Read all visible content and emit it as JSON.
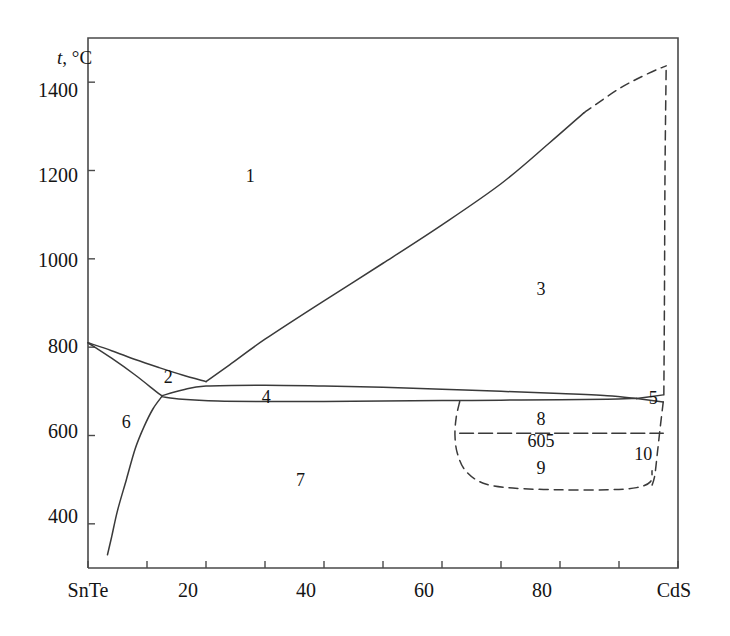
{
  "figure": {
    "kind": "binary-phase-diagram",
    "system": "SnTe - CdS"
  },
  "axes": {
    "y_title_symbol": "t",
    "y_title_unit": ", °C",
    "y_ticks": [
      "1400",
      "1200",
      "1000",
      "800",
      "600",
      "400"
    ],
    "x_ticks": [
      "SnTe",
      "20",
      "40",
      "60",
      "80",
      "CdS"
    ]
  },
  "annotations": {
    "region_1": "1",
    "region_2": "2",
    "region_3": "3",
    "region_4": "4",
    "region_5": "5",
    "region_6": "6",
    "region_7": "7",
    "region_8": "8",
    "region_9": "9",
    "region_10": "10",
    "invariant_temperature": "605"
  },
  "colors": {
    "line": "#3a3a3a",
    "frame": "#4a4a4a",
    "text": "#141414",
    "background": "#ffffff"
  },
  "chart_data": {
    "type": "line",
    "title": "",
    "xlabel": "",
    "ylabel": "t, °C",
    "xlim": [
      0,
      100
    ],
    "ylim": [
      300,
      1500
    ],
    "x_tick_values": [
      0,
      20,
      40,
      60,
      80,
      100
    ],
    "x_tick_labels": [
      "SnTe",
      "20",
      "40",
      "60",
      "80",
      "CdS"
    ],
    "y_tick_values": [
      400,
      600,
      800,
      1000,
      1200,
      1400
    ],
    "y_tick_labels": [
      "400",
      "600",
      "800",
      "1000",
      "1200",
      "1400"
    ],
    "grid": false,
    "legend": "none",
    "series": [
      {
        "name": "liquidus-left-branch",
        "style": "solid",
        "points": [
          [
            0,
            810
          ],
          [
            4,
            792
          ],
          [
            8,
            772
          ],
          [
            12,
            754
          ],
          [
            16,
            737
          ],
          [
            20,
            722
          ]
        ]
      },
      {
        "name": "solidus-left-branch-to-eutectic",
        "style": "solid",
        "points": [
          [
            0,
            810
          ],
          [
            4,
            775
          ],
          [
            8,
            737
          ],
          [
            11.5,
            700
          ],
          [
            12.5,
            690
          ]
        ]
      },
      {
        "name": "liquidus-right-branch-solid",
        "style": "solid",
        "points": [
          [
            20,
            722
          ],
          [
            24,
            760
          ],
          [
            30,
            818
          ],
          [
            40,
            905
          ],
          [
            50,
            990
          ],
          [
            60,
            1077
          ],
          [
            70,
            1170
          ],
          [
            78,
            1260
          ],
          [
            84,
            1330
          ]
        ]
      },
      {
        "name": "liquidus-right-branch-dashed",
        "style": "dashed",
        "points": [
          [
            84,
            1330
          ],
          [
            90,
            1385
          ],
          [
            95,
            1420
          ],
          [
            98,
            1437
          ]
        ]
      },
      {
        "name": "upper-solidus-plateau",
        "style": "solid",
        "points": [
          [
            12.5,
            690
          ],
          [
            16,
            703
          ],
          [
            20,
            712
          ],
          [
            30,
            714
          ],
          [
            40,
            712
          ],
          [
            50,
            709
          ],
          [
            60,
            705
          ],
          [
            70,
            700
          ],
          [
            80,
            695
          ],
          [
            88,
            690
          ],
          [
            93,
            684
          ]
        ]
      },
      {
        "name": "lower-solidus-plateau",
        "style": "solid",
        "points": [
          [
            12.5,
            688
          ],
          [
            16,
            682
          ],
          [
            22,
            678
          ],
          [
            30,
            677
          ],
          [
            40,
            677
          ],
          [
            50,
            678
          ],
          [
            60,
            679
          ],
          [
            70,
            680
          ],
          [
            80,
            681
          ],
          [
            88,
            682
          ],
          [
            93,
            684
          ]
        ]
      },
      {
        "name": "wedge-upper-to-CdS",
        "style": "solid",
        "points": [
          [
            93,
            684
          ],
          [
            97.5,
            692
          ]
        ]
      },
      {
        "name": "wedge-lower-to-CdS",
        "style": "solid",
        "points": [
          [
            93,
            684
          ],
          [
            97.5,
            676
          ]
        ]
      },
      {
        "name": "solvus-SnTe-side",
        "style": "solid",
        "points": [
          [
            12.5,
            688
          ],
          [
            11,
            660
          ],
          [
            9.5,
            620
          ],
          [
            8,
            570
          ],
          [
            6.5,
            500
          ],
          [
            5,
            430
          ],
          [
            4,
            370
          ],
          [
            3.3,
            330
          ]
        ]
      },
      {
        "name": "solvus-CdS-side-dashed",
        "style": "dashed",
        "points": [
          [
            97.5,
            676
          ],
          [
            97,
            620
          ],
          [
            96.5,
            560
          ],
          [
            96,
            505
          ],
          [
            95.3,
            478
          ]
        ]
      },
      {
        "name": "invariant-line-605",
        "style": "dash-dot",
        "temperature": 605,
        "points": [
          [
            63,
            605
          ],
          [
            97.5,
            605
          ]
        ]
      },
      {
        "name": "miscibility-dome-dashed",
        "style": "dashed",
        "points": [
          [
            63,
            677
          ],
          [
            62.4,
            640
          ],
          [
            62.2,
            600
          ],
          [
            62.6,
            560
          ],
          [
            64,
            520
          ],
          [
            67,
            492
          ],
          [
            72,
            481
          ],
          [
            80,
            477
          ],
          [
            88,
            477
          ],
          [
            93,
            482
          ],
          [
            95.3,
            495
          ],
          [
            95.6,
            520
          ]
        ]
      },
      {
        "name": "CdS-vertical-dashed",
        "style": "dashed",
        "points": [
          [
            97.6,
            692
          ],
          [
            97.7,
            900
          ],
          [
            97.8,
            1200
          ],
          [
            98,
            1437
          ]
        ]
      }
    ],
    "region_labels": [
      {
        "text": "1",
        "x": 27.5,
        "y": 1186
      },
      {
        "text": "2",
        "x": 13.6,
        "y": 731
      },
      {
        "text": "3",
        "x": 76.8,
        "y": 930
      },
      {
        "text": "4",
        "x": 30.2,
        "y": 686
      },
      {
        "text": "5",
        "x": 95.8,
        "y": 682
      },
      {
        "text": "6",
        "x": 6.5,
        "y": 628
      },
      {
        "text": "7",
        "x": 36.0,
        "y": 497
      },
      {
        "text": "8",
        "x": 76.8,
        "y": 636
      },
      {
        "text": "605",
        "x": 76.8,
        "y": 585
      },
      {
        "text": "9",
        "x": 76.8,
        "y": 525
      },
      {
        "text": "10",
        "x": 94.1,
        "y": 555
      }
    ]
  }
}
